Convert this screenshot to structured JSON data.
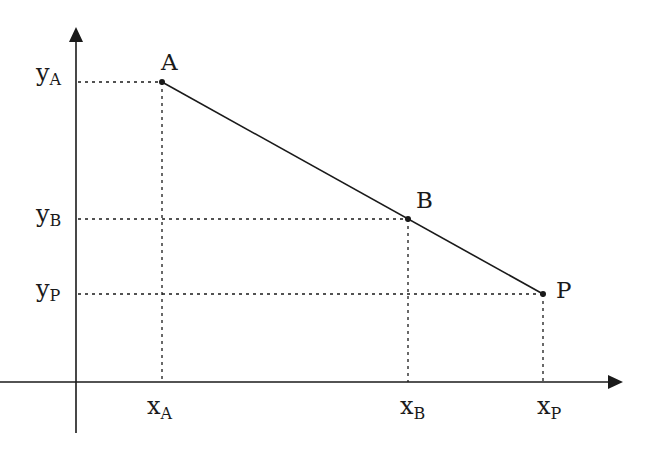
{
  "diagram": {
    "type": "coordinate-line-diagram",
    "colors": {
      "ink": "#1a1a1a",
      "background": "#ffffff"
    },
    "axes": {
      "x_axis": {
        "y": 382,
        "x_start": 0,
        "x_end": 622
      },
      "y_axis": {
        "x": 76,
        "y_start": 433,
        "y_end": 28
      }
    },
    "points": [
      {
        "id": "A",
        "label": "A",
        "x": 162,
        "y": 82
      },
      {
        "id": "B",
        "label": "B",
        "x": 408,
        "y": 219
      },
      {
        "id": "P",
        "label": "P",
        "x": 543,
        "y": 294
      }
    ],
    "segment": {
      "from": "A",
      "to": "P",
      "through": "B"
    },
    "x_labels": [
      {
        "base": "x",
        "sub": "A"
      },
      {
        "base": "x",
        "sub": "B"
      },
      {
        "base": "x",
        "sub": "P"
      }
    ],
    "y_labels": [
      {
        "base": "y",
        "sub": "A"
      },
      {
        "base": "y",
        "sub": "B"
      },
      {
        "base": "y",
        "sub": "P"
      }
    ]
  }
}
